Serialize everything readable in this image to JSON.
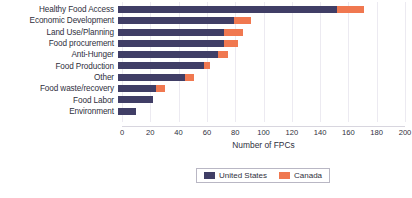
{
  "chart_data": {
    "type": "bar",
    "orientation": "horizontal",
    "stacked": true,
    "title": "",
    "xlabel": "Number of FPCs",
    "ylabel": "",
    "xlim": [
      0,
      200
    ],
    "xticks": [
      0,
      20,
      40,
      60,
      80,
      100,
      120,
      140,
      160,
      180,
      200
    ],
    "xtick_labels": [
      "0",
      "20",
      "40",
      "60",
      "80",
      "100",
      "120",
      "140",
      "160",
      "180",
      "200"
    ],
    "grid": true,
    "grid_axis": "x",
    "legend_position": "bottom-center",
    "categories": [
      "Healthy Food Access",
      "Economic Development",
      "Land Use/Planning",
      "Food procurement",
      "Anti-Hunger",
      "Food Production",
      "Other",
      "Food waste/recovery",
      "Food Labor",
      "Environment"
    ],
    "series": [
      {
        "name": "United States",
        "color": "#403E66",
        "values": [
          155,
          82,
          75,
          75,
          71,
          61,
          47,
          27,
          25,
          13
        ]
      },
      {
        "name": "Canada",
        "color": "#F07850",
        "values": [
          19,
          12,
          13,
          10,
          7,
          4,
          7,
          6,
          0,
          0
        ]
      }
    ],
    "totals": [
      174,
      94,
      88,
      85,
      78,
      65,
      54,
      33,
      25,
      13
    ]
  },
  "legend": {
    "items": [
      {
        "label": "United States",
        "color": "#403E66"
      },
      {
        "label": "Canada",
        "color": "#F07850"
      }
    ]
  },
  "colors": {
    "united_states": "#403E66",
    "canada": "#F07850",
    "gridline": "#eceaf1",
    "text": "#2f2f3d",
    "background": "#ffffff"
  }
}
